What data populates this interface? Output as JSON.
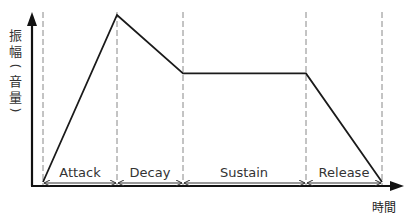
{
  "diagram": {
    "y_axis_label": [
      "振",
      "幅",
      "(",
      "音",
      "量",
      ")"
    ],
    "x_axis_label": "時間",
    "phases": [
      {
        "name": "Attack",
        "label": "Attack"
      },
      {
        "name": "Decay",
        "label": "Decay"
      },
      {
        "name": "Sustain",
        "label": "Sustain"
      },
      {
        "name": "Release",
        "label": "Release"
      }
    ],
    "envelope_points": [
      {
        "phase_boundary": "start",
        "amplitude": 0.0
      },
      {
        "phase_boundary": "attack_end",
        "amplitude": 1.0
      },
      {
        "phase_boundary": "decay_end",
        "amplitude": 0.65
      },
      {
        "phase_boundary": "sustain_end",
        "amplitude": 0.65
      },
      {
        "phase_boundary": "release_end",
        "amplitude": 0.0
      }
    ],
    "colors": {
      "line": "#1a1a1a",
      "dashed": "#888888",
      "text": "#333333"
    }
  }
}
